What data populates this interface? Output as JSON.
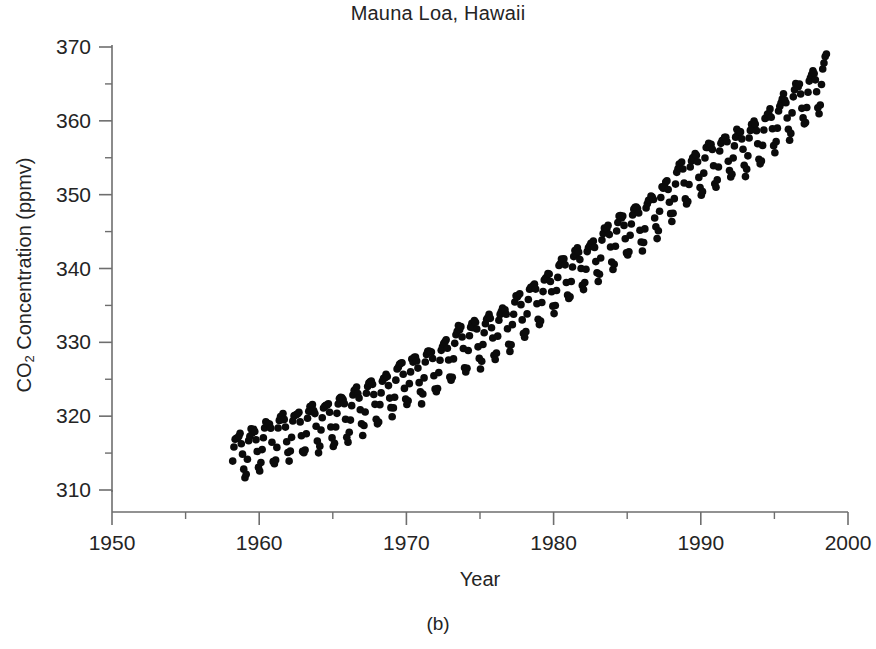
{
  "figure": {
    "title": "Mauna Loa, Hawaii",
    "caption": "(b)",
    "background_color": "#ffffff",
    "ink_color": "#0b0b0b",
    "axis_color": "#6e6e6e"
  },
  "axes": {
    "x": {
      "label": "Year",
      "min": 1950,
      "max": 2000,
      "major_ticks": [
        1950,
        1960,
        1970,
        1980,
        1990,
        2000
      ],
      "major_tick_labels": [
        "1950",
        "1960",
        "1970",
        "1980",
        "1990",
        "2000"
      ],
      "minor_tick_interval": 5,
      "minor_ticks": [
        1955,
        1965,
        1975,
        1985,
        1995
      ]
    },
    "y": {
      "label": "CO2 Concentration (ppmv)",
      "label_main": "CO",
      "label_sub": "2",
      "label_rest": " Concentration (ppmv)",
      "min": 310,
      "max": 370,
      "major_ticks": [
        310,
        320,
        330,
        340,
        350,
        360,
        370
      ],
      "major_tick_labels": [
        "310",
        "320",
        "330",
        "340",
        "350",
        "360",
        "370"
      ],
      "minor_tick_interval": 5,
      "minor_ticks": [
        315,
        325,
        335,
        345,
        355,
        365
      ]
    }
  },
  "chart_data": {
    "type": "scatter",
    "title": "Mauna Loa, Hawaii",
    "xlabel": "Year",
    "ylabel": "CO2 Concentration (ppmv)",
    "xlim": [
      1950,
      2000
    ],
    "ylim": [
      310,
      370
    ],
    "grid": false,
    "legend": "none",
    "marker": "filled-circle",
    "marker_size_px": 7.6,
    "series": [
      {
        "name": "Monthly mean CO2",
        "x_start": 1958.2,
        "x_end": 1998.6,
        "samples_per_year": 12,
        "trend_model": "quadratic",
        "trend_coefficients": {
          "c0": 314.6,
          "c1": 0.8,
          "c2": 0.0126,
          "t_reference_year": 1958.2,
          "formula": "baseline(t) = c0 + c1*(t - t_ref) + c2*(t - t_ref)^2"
        },
        "seasonal_model": {
          "amplitude_ppmv": 3.05,
          "second_harmonic_ppmv": 0.9,
          "peak_month": "May",
          "trough_month": "September",
          "formula": "seasonal(t) = A*sin(2*pi*(t - 0.29)) + A2*sin(4*pi*(t - 0.16))"
        },
        "noise_ppmv": 0.45,
        "annual_means": [
          {
            "year": 1958,
            "value": 315.3
          },
          {
            "year": 1959,
            "value": 315.9
          },
          {
            "year": 1960,
            "value": 316.9
          },
          {
            "year": 1961,
            "value": 317.6
          },
          {
            "year": 1962,
            "value": 318.4
          },
          {
            "year": 1963,
            "value": 318.9
          },
          {
            "year": 1964,
            "value": 319.6
          },
          {
            "year": 1965,
            "value": 320.0
          },
          {
            "year": 1966,
            "value": 321.3
          },
          {
            "year": 1967,
            "value": 322.1
          },
          {
            "year": 1968,
            "value": 323.0
          },
          {
            "year": 1969,
            "value": 324.6
          },
          {
            "year": 1970,
            "value": 325.6
          },
          {
            "year": 1971,
            "value": 326.3
          },
          {
            "year": 1972,
            "value": 327.4
          },
          {
            "year": 1973,
            "value": 329.7
          },
          {
            "year": 1974,
            "value": 330.2
          },
          {
            "year": 1975,
            "value": 331.1
          },
          {
            "year": 1976,
            "value": 332.0
          },
          {
            "year": 1977,
            "value": 333.8
          },
          {
            "year": 1978,
            "value": 335.4
          },
          {
            "year": 1979,
            "value": 336.8
          },
          {
            "year": 1980,
            "value": 338.7
          },
          {
            "year": 1981,
            "value": 340.1
          },
          {
            "year": 1982,
            "value": 341.4
          },
          {
            "year": 1983,
            "value": 343.0
          },
          {
            "year": 1984,
            "value": 344.6
          },
          {
            "year": 1985,
            "value": 346.0
          },
          {
            "year": 1986,
            "value": 347.4
          },
          {
            "year": 1987,
            "value": 349.2
          },
          {
            "year": 1988,
            "value": 351.6
          },
          {
            "year": 1989,
            "value": 353.1
          },
          {
            "year": 1990,
            "value": 354.4
          },
          {
            "year": 1991,
            "value": 355.6
          },
          {
            "year": 1992,
            "value": 356.4
          },
          {
            "year": 1993,
            "value": 357.1
          },
          {
            "year": 1994,
            "value": 358.8
          },
          {
            "year": 1995,
            "value": 360.8
          },
          {
            "year": 1996,
            "value": 362.6
          },
          {
            "year": 1997,
            "value": 363.8
          },
          {
            "year": 1998,
            "value": 366.6
          }
        ]
      }
    ]
  },
  "plot_geometry": {
    "left_px": 112,
    "right_px": 848,
    "top_px": 47,
    "bottom_px": 490,
    "axis_baseline_px": 512,
    "major_tick_len_px": 13,
    "minor_tick_len_px": 7
  }
}
